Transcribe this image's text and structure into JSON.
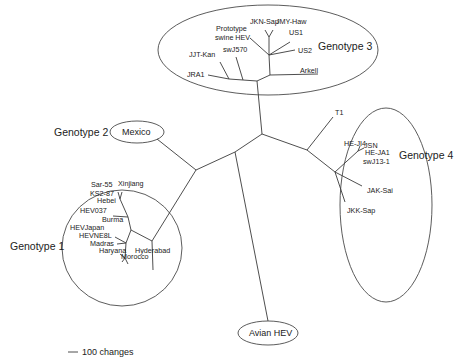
{
  "diagram": {
    "type": "unrooted phylogenetic tree",
    "genotypes": {
      "g1": {
        "label": "Genotype 1",
        "leaves": [
          "Sar-55",
          "Xinjiang",
          "KS2-87",
          "Hebei",
          "HEV037",
          "Burma",
          "HEVJapan",
          "HEVNE8L",
          "Madras",
          "Haryana",
          "Morocco",
          "Hyderabad"
        ]
      },
      "g2": {
        "label": "Genotype 2",
        "leaves": [
          "Mexico"
        ]
      },
      "g3": {
        "label": "Genotype 3",
        "leaves": [
          "JKN-Sap",
          "JMY-Haw",
          "Prototype",
          "swine HEV",
          "US1",
          "swJ570",
          "US2",
          "JJT-Kan",
          "JRA1",
          "Arkell"
        ]
      },
      "g4": {
        "label": "Genotype 4",
        "leaves": [
          "T1",
          "HE-JI4",
          "JSN",
          "HE-JA1",
          "swJ13-1",
          "JAK-Sai",
          "JKK-Sap"
        ]
      },
      "avian": {
        "label": "Avian HEV"
      }
    },
    "scale_bar": {
      "label": "100 changes"
    }
  }
}
